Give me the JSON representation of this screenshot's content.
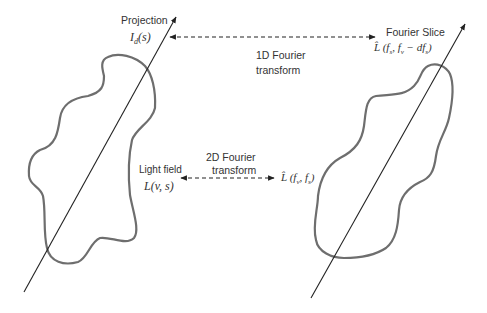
{
  "diagram": {
    "type": "fourier-slice-theorem-illustration",
    "colors": {
      "background": "#ffffff",
      "blob_stroke": "#6e6e6e",
      "axis_stroke": "#222222",
      "arrow_stroke": "#222222",
      "text": "#333333"
    },
    "left_panel": {
      "projection_label": "Projection",
      "projection_math": "I_d(s)",
      "projection_math_display": "Id(s)",
      "lightfield_label": "Light field",
      "lightfield_math_display": "L(v, s)"
    },
    "right_panel": {
      "slice_label": "Fourier Slice",
      "slice_math_display": "L̂ (fs, fv − dfs)",
      "spectrum_math_display": "L̂ (fv, fs)"
    },
    "arrows": {
      "top": {
        "label_line1": "1D Fourier",
        "label_line2": "transform",
        "style": "dashed",
        "direction": "bidirectional"
      },
      "bottom": {
        "label_line1": "2D Fourier",
        "label_line2": "transform",
        "style": "dashed",
        "direction": "bidirectional"
      }
    }
  }
}
